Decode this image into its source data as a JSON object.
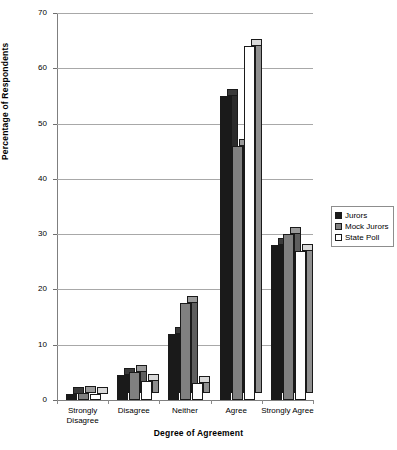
{
  "chart_data": {
    "type": "bar",
    "title": "",
    "xlabel": "Degree of Agreement",
    "ylabel": "Percentage of Respondents",
    "ylim": [
      0,
      70
    ],
    "yticks": [
      0,
      10,
      20,
      30,
      40,
      50,
      60,
      70
    ],
    "grid": true,
    "legend_position": "right",
    "style": "3d-clustered-column",
    "categories": [
      "Strongly Disagree",
      "Disagree",
      "Neither",
      "Agree",
      "Strongly Agree"
    ],
    "series": [
      {
        "name": "Jurors",
        "color": "#1a1a1a",
        "values": [
          1.0,
          4.5,
          12.0,
          55.0,
          28.0
        ]
      },
      {
        "name": "Mock Jurors",
        "color": "#808080",
        "values": [
          1.2,
          5.0,
          17.5,
          46.0,
          30.0
        ]
      },
      {
        "name": "State Poll",
        "color": "#ffffff",
        "values": [
          1.0,
          3.5,
          3.0,
          64.0,
          27.0
        ]
      }
    ]
  },
  "axis": {
    "y_tick_labels": [
      "0",
      "10",
      "20",
      "30",
      "40",
      "50",
      "60",
      "70"
    ],
    "x_category_labels": [
      [
        "Strongly",
        "Disagree"
      ],
      [
        "Disagree"
      ],
      [
        "Neither"
      ],
      [
        "Agree"
      ],
      [
        "Strongly Agree"
      ]
    ],
    "x_title": "Degree of Agreement",
    "y_title": "Percentage of Respondents"
  },
  "legend": {
    "items": [
      {
        "label": "Jurors",
        "color": "#1a1a1a"
      },
      {
        "label": "Mock Jurors",
        "color": "#808080"
      },
      {
        "label": "State Poll",
        "color": "#ffffff"
      }
    ]
  },
  "colors": {
    "series_jurors": "#1a1a1a",
    "series_mock_jurors": "#808080",
    "series_state_poll": "#ffffff",
    "gridline": "#a8a8a8",
    "axis": "#7f7f7f",
    "background": "#ffffff"
  }
}
